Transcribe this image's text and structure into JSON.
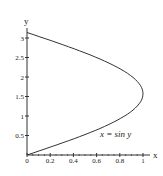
{
  "chart_data": {
    "type": "line",
    "title": "",
    "xlabel": "x",
    "ylabel": "y",
    "xlim": [
      0,
      1.05
    ],
    "ylim": [
      0,
      3.2
    ],
    "x_ticks": [
      "0",
      "0.2",
      "0.4",
      "0.6",
      "0.8",
      "1"
    ],
    "y_ticks": [
      "0.5",
      "1",
      "1.5",
      "2",
      "2.5",
      "3"
    ],
    "grid": false,
    "legend": null,
    "annotations": [
      {
        "text": "x = sin y",
        "x": 0.8,
        "y": 0.45
      }
    ],
    "series": [
      {
        "name": "x = sin y",
        "x": [
          0,
          0.156,
          0.309,
          0.454,
          0.588,
          0.707,
          0.809,
          0.891,
          0.951,
          0.988,
          1.0,
          0.988,
          0.951,
          0.891,
          0.809,
          0.707,
          0.588,
          0.454,
          0.309,
          0.156,
          0
        ],
        "y": [
          0,
          0.157,
          0.314,
          0.471,
          0.628,
          0.785,
          0.942,
          1.1,
          1.257,
          1.414,
          1.571,
          1.728,
          1.885,
          2.042,
          2.199,
          2.356,
          2.513,
          2.67,
          2.827,
          2.985,
          3.142
        ]
      }
    ],
    "color": "#333333"
  }
}
